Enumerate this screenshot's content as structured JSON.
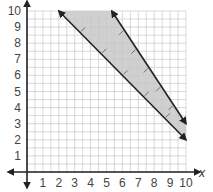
{
  "chart_data": {
    "type": "line",
    "title": "",
    "xlabel": "x",
    "ylabel": "",
    "xlim": [
      0,
      10
    ],
    "ylim": [
      0,
      10
    ],
    "grid": true,
    "minor_grid_step": 0.5,
    "x_ticks": [
      "1",
      "2",
      "3",
      "4",
      "5",
      "6",
      "7",
      "8",
      "9",
      "10"
    ],
    "y_ticks": [
      "1",
      "2",
      "3",
      "4",
      "5",
      "6",
      "7",
      "8",
      "9",
      "10"
    ],
    "series": [
      {
        "name": "lower boundary",
        "equation": "y = -x + 12",
        "points": [
          [
            2,
            10
          ],
          [
            10,
            2
          ]
        ],
        "style": "solid",
        "arrows": "both",
        "shade_side": "above"
      },
      {
        "name": "upper boundary",
        "equation": "y = -1.5x + 18",
        "points": [
          [
            5.33,
            10
          ],
          [
            10,
            3
          ]
        ],
        "style": "solid",
        "arrows": "both",
        "shade_side": "below"
      }
    ],
    "shaded_region": {
      "description": "region between the two lines",
      "color": "#cfcfcf"
    },
    "colors": {
      "grid": "#c8c8c8",
      "axis": "#222222",
      "line": "#222222",
      "shade": "#d0d0d0"
    }
  }
}
